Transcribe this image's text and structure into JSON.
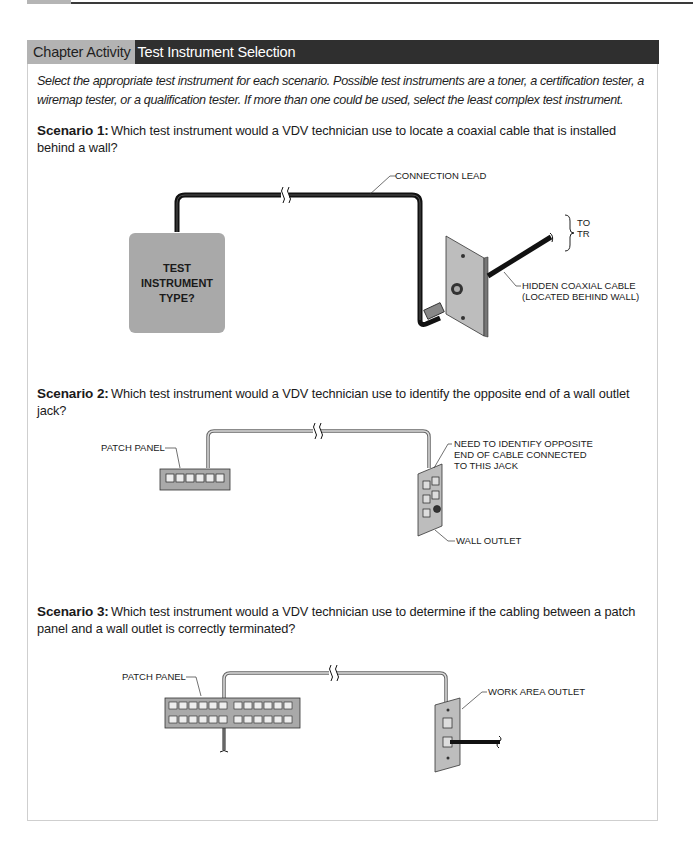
{
  "header": {
    "label": "Chapter Activity",
    "title": "Test Instrument Selection"
  },
  "intro": "Select the appropriate test instrument for each scenario. Possible test instruments are a toner, a certification tester, a wiremap tester, or a qualification tester. If more than one could be used, select the least complex test instrument.",
  "scenarios": [
    {
      "label": "Scenario 1:",
      "question": "Which test instrument would a VDV technician use to locate a coaxial cable that is installed behind a wall?",
      "figure": {
        "instrument_text": [
          "TEST",
          "INSTRUMENT",
          "TYPE?"
        ],
        "callouts": {
          "lead": "CONNECTION LEAD",
          "to": "TO",
          "tr": "TR",
          "hidden1": "HIDDEN COAXIAL CABLE",
          "hidden2": "(LOCATED BEHIND WALL)"
        }
      }
    },
    {
      "label": "Scenario 2:",
      "question": "Which test instrument would a VDV technician use to identify the opposite end of a wall outlet jack?",
      "figure": {
        "callouts": {
          "patch_panel": "PATCH PANEL",
          "need1": "NEED TO IDENTIFY OPPOSITE",
          "need2": "END OF CABLE CONNECTED",
          "need3": "TO THIS JACK",
          "wall_outlet": "WALL OUTLET"
        }
      }
    },
    {
      "label": "Scenario 3:",
      "question": "Which test instrument would a VDV technician use to determine if the cabling between a patch panel and a wall outlet is correctly terminated?",
      "figure": {
        "callouts": {
          "patch_panel": "PATCH PANEL",
          "work_area": "WORK AREA OUTLET"
        }
      }
    }
  ],
  "colors": {
    "header_label_bg": "#b3b3b3",
    "header_title_bg": "#2f2f2f",
    "instrument_box": "#a9a9a9",
    "plate": "#bdbdbd"
  }
}
